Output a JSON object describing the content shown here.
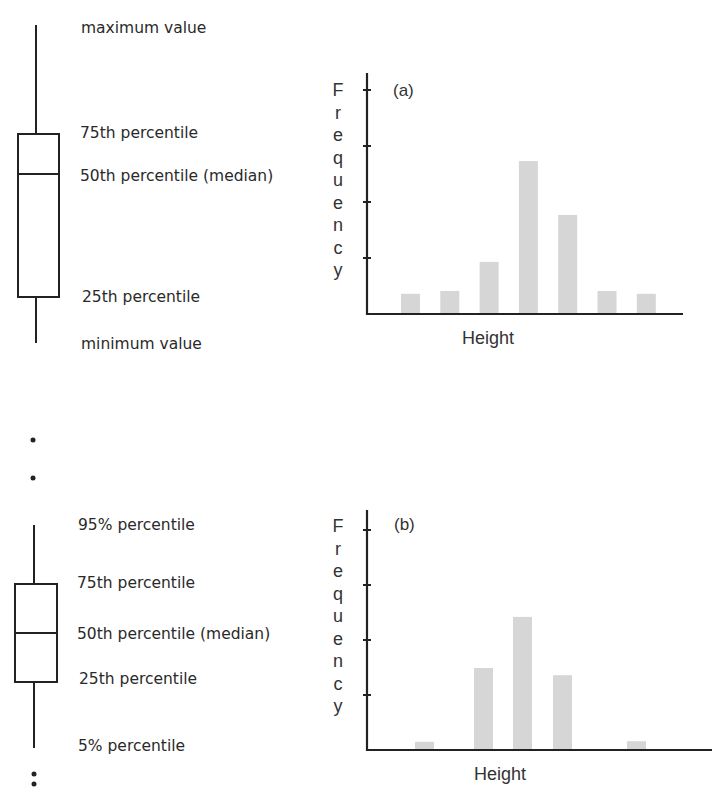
{
  "colors": {
    "ink": "#222222",
    "bar_fill": "#d6d6d6",
    "text": "#2a2a2a"
  },
  "boxplots": [
    {
      "id": "top",
      "labels": {
        "upper_whisker": "maximum value",
        "q3": "75th percentile",
        "median": "50th percentile (median)",
        "q1": "25th percentile",
        "lower_whisker": "minimum value"
      },
      "outliers_above": 0,
      "outliers_below": 0
    },
    {
      "id": "bottom",
      "labels": {
        "upper_whisker": "95% percentile",
        "q3": "75th percentile",
        "median": "50th percentile (median)",
        "q1": "25th percentile",
        "lower_whisker": "5% percentile"
      },
      "outliers_above": 2,
      "outliers_below": 2
    }
  ],
  "chart_data": [
    {
      "type": "bar",
      "title": "(a)",
      "xlabel": "Height",
      "ylabel": "Frequency",
      "ylim": [
        0,
        4.3
      ],
      "yticks": [
        1,
        2,
        3,
        4
      ],
      "ytick_labels": [
        "",
        "",
        "",
        ""
      ],
      "categories": [
        "1",
        "2",
        "3",
        "4",
        "5",
        "6",
        "7"
      ],
      "values": [
        0.36,
        0.41,
        0.93,
        2.73,
        1.77,
        0.41,
        0.36
      ],
      "grid": false,
      "legend": "none"
    },
    {
      "type": "bar",
      "title": "(b)",
      "xlabel": "Height",
      "ylabel": "Frequency",
      "ylim": [
        0,
        4.1
      ],
      "yticks": [
        1,
        2,
        3,
        4
      ],
      "ytick_labels": [
        "",
        "",
        "",
        ""
      ],
      "categories": [
        "1",
        "2",
        "3",
        "4",
        "5",
        "6",
        "7",
        "8"
      ],
      "values": [
        0.15,
        0,
        1.49,
        2.42,
        1.36,
        0,
        0.16,
        0
      ],
      "grid": false,
      "legend": "none"
    }
  ]
}
